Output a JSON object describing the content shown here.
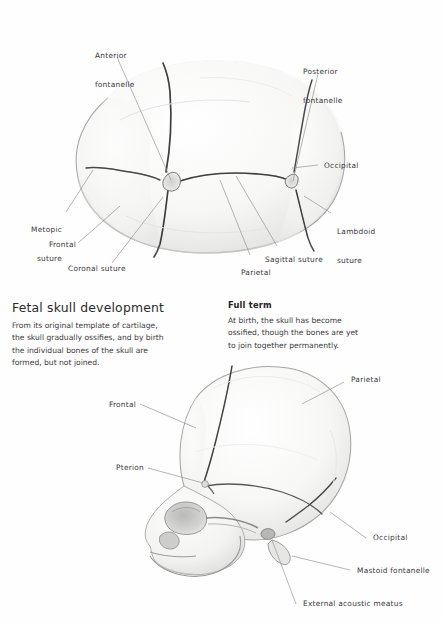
{
  "figure": {
    "kind": "anatomical-illustration",
    "subject": "Fetal skull development",
    "views": [
      {
        "name": "superior-view-fetal-skull",
        "position": "top"
      },
      {
        "name": "lateral-view-full-term-skull",
        "position": "bottom"
      }
    ]
  },
  "text_blocks": {
    "left": {
      "heading": "Fetal skull development",
      "lines": [
        "From its original template of cartilage,",
        "the skull gradually ossifies, and by birth",
        "the individual bones of the skull are",
        "formed, but not joined."
      ]
    },
    "right": {
      "heading": "Full term",
      "lines": [
        "At birth, the skull has become",
        "ossified, though the bones are yet",
        "to join together permanently."
      ]
    }
  },
  "labels_top": [
    {
      "id": "anterior-fontanelle",
      "lines": [
        "Anterior",
        "fontanelle"
      ],
      "align": "left"
    },
    {
      "id": "posterior-fontanelle",
      "lines": [
        "Posterior",
        "fontanelle"
      ],
      "align": "left"
    },
    {
      "id": "occipital",
      "lines": [
        "Occipital"
      ],
      "align": "left"
    },
    {
      "id": "lambdoid-suture",
      "lines": [
        "Lambdoid",
        "suture"
      ],
      "align": "left"
    },
    {
      "id": "sagittal-suture",
      "lines": [
        "Sagittal suture"
      ],
      "align": "left"
    },
    {
      "id": "parietal",
      "lines": [
        "Parietal"
      ],
      "align": "left"
    },
    {
      "id": "coronal-suture",
      "lines": [
        "Coronal suture"
      ],
      "align": "left"
    },
    {
      "id": "frontal",
      "lines": [
        "Frontal"
      ],
      "align": "right"
    },
    {
      "id": "metopic-suture",
      "lines": [
        "Metopic",
        "suture"
      ],
      "align": "right"
    }
  ],
  "labels_bottom": [
    {
      "id": "parietal-lateral",
      "lines": [
        "Parietal"
      ],
      "align": "left"
    },
    {
      "id": "frontal-lateral",
      "lines": [
        "Frontal"
      ],
      "align": "right"
    },
    {
      "id": "pterion",
      "lines": [
        "Pterion"
      ],
      "align": "right"
    },
    {
      "id": "occipital-lateral",
      "lines": [
        "Occipital"
      ],
      "align": "left"
    },
    {
      "id": "mastoid-fontanelle",
      "lines": [
        "Mastoid fontanelle"
      ],
      "align": "left"
    },
    {
      "id": "external-acoustic-meatus",
      "lines": [
        "External acoustic meatus"
      ],
      "align": "left"
    }
  ],
  "colors": {
    "background": "#fefefe",
    "bone_fill": "#f6f6f5",
    "bone_shadow": "#dedede",
    "outline": "#9a9a9a",
    "suture": "#4a4a4a",
    "leader": "#8e8e8e",
    "text": "#3a3a3a",
    "heading": "#2b2b2b"
  }
}
